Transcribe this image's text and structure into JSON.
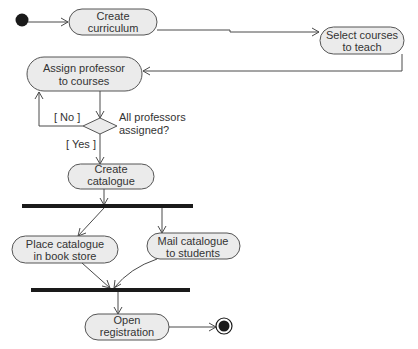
{
  "diagram": {
    "type": "uml-activity",
    "actions": {
      "create_curriculum": [
        "Create",
        "curriculum"
      ],
      "select_courses": [
        "Select courses",
        "to teach"
      ],
      "assign_professor": [
        "Assign professor",
        "to courses"
      ],
      "create_catalogue": [
        "Create",
        "catalogue"
      ],
      "place_catalogue": [
        "Place catalogue",
        "in book store"
      ],
      "mail_catalogue": [
        "Mail catalogue",
        "to students"
      ],
      "open_registration": [
        "Open",
        "registration"
      ]
    },
    "decision": {
      "question": [
        "All professors",
        "assigned?"
      ],
      "guard_no": "[ No ]",
      "guard_yes": "[ Yes ]"
    },
    "flows": [
      [
        "initial",
        "create_curriculum"
      ],
      [
        "create_curriculum",
        "select_courses"
      ],
      [
        "select_courses",
        "assign_professor"
      ],
      [
        "assign_professor",
        "decision"
      ],
      [
        "decision",
        "assign_professor",
        "[ No ]"
      ],
      [
        "decision",
        "create_catalogue",
        "[ Yes ]"
      ],
      [
        "create_catalogue",
        "fork"
      ],
      [
        "fork",
        "place_catalogue"
      ],
      [
        "fork",
        "mail_catalogue"
      ],
      [
        "place_catalogue",
        "join"
      ],
      [
        "mail_catalogue",
        "join"
      ],
      [
        "join",
        "open_registration"
      ],
      [
        "open_registration",
        "final"
      ]
    ],
    "colors": {
      "node_fill": "#ebebeb",
      "stroke": "#555555",
      "bar": "#1a1a1a",
      "text": "#333333"
    }
  }
}
